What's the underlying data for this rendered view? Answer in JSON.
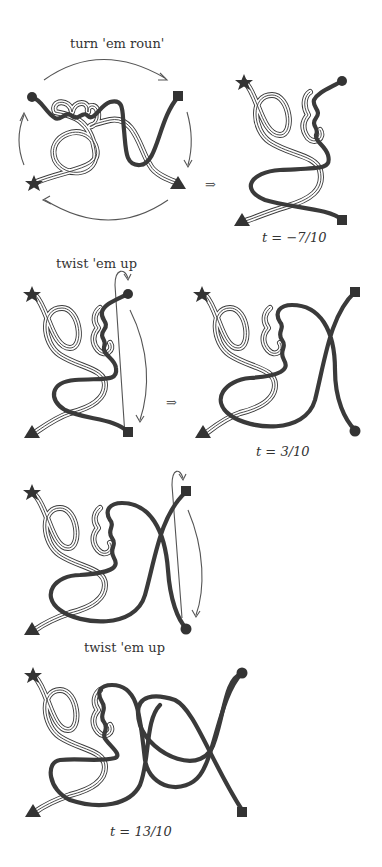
{
  "figure": {
    "panels": [
      {
        "id": "p1",
        "caption": "turn 'em roun'",
        "kind": "operation"
      },
      {
        "id": "p2",
        "caption": "t = −7/10",
        "kind": "result"
      },
      {
        "id": "p3",
        "caption": "twist 'em up",
        "kind": "operation"
      },
      {
        "id": "p4",
        "caption": "t = 3/10",
        "kind": "result"
      },
      {
        "id": "p5",
        "caption": "twist 'em up",
        "kind": "operation"
      },
      {
        "id": "p6",
        "caption": "t = 13/10",
        "kind": "result"
      }
    ],
    "implies_symbol": "⇒",
    "endpoint_markers": [
      "circle",
      "square",
      "star",
      "triangle"
    ],
    "strand_styles": [
      "thick-dark",
      "ribbon-double-line"
    ]
  }
}
